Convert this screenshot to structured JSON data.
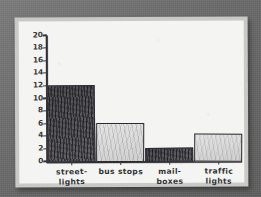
{
  "media": {
    "kind": "photographed-pencil-drawing",
    "backdrop_color": "#6a6a6a",
    "paper_color": "#f4f4f2",
    "paper_border_color": "#c9c9c7",
    "ink_color": "#2f2f33"
  },
  "chart_data": {
    "type": "bar",
    "title": "",
    "xlabel": "",
    "ylabel": "",
    "categories": [
      "street-\nlights",
      "bus stops",
      "mail-\nboxes",
      "traffic\nlights"
    ],
    "category_labels_flat": [
      "street-lights",
      "bus stops",
      "mail-boxes",
      "traffic lights"
    ],
    "values": [
      12,
      6,
      2,
      4.3
    ],
    "ylim": [
      0,
      20
    ],
    "ytick_values": [
      20,
      18,
      16,
      14,
      12,
      10,
      8,
      6,
      4,
      2,
      0
    ],
    "ytick_labels": [
      "20",
      "18",
      "16",
      "14",
      "12",
      "10",
      "8",
      "6",
      "4",
      "2",
      "0"
    ],
    "grid": false,
    "legend": false,
    "legend_position": "none",
    "bar_fills": [
      "dark-graphite",
      "light-pencil",
      "dark-graphite",
      "light-pencil"
    ],
    "bar_colors": [
      "#55555a",
      "#cfcfce",
      "#4f4f55",
      "#cfcfce"
    ],
    "bar_outline_color": "#2b2b30"
  },
  "axes": {
    "y_axis_name": "y-axis",
    "x_axis_name": "x-axis",
    "baseline_label": "0"
  }
}
